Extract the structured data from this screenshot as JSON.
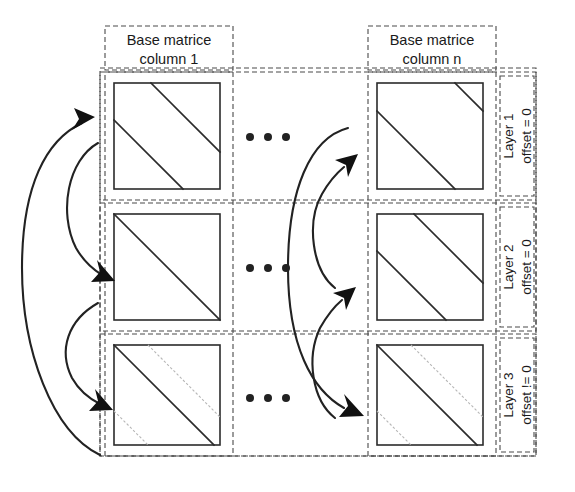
{
  "figure": {
    "background_color": "#ffffff",
    "line_color": "#2b2b2b",
    "dashed_color": "#4a4a4a",
    "faint_color": "#b6b6b6"
  },
  "columns": [
    {
      "id": "col1",
      "line1": "Base matrice",
      "line2": "column 1"
    },
    {
      "id": "coln",
      "line1": "Base matrice",
      "line2": "column n"
    }
  ],
  "ellipsis": {
    "glyph": "•••",
    "count": 3
  },
  "layers": [
    {
      "id": "layer1",
      "name": "Layer 1",
      "offset": "offset = 0"
    },
    {
      "id": "layer2",
      "name": "Layer 2",
      "offset": "offset = 0"
    },
    {
      "id": "layer3",
      "name": "Layer 3",
      "offset": "offset != 0"
    }
  ],
  "cells": [
    {
      "layer": "Layer 1",
      "column": "column 1",
      "pattern": "two-parallel-anti-diagonals",
      "description": "shifted identity: upper diagonal from top edge to right edge, lower diagonal from left edge to bottom edge"
    },
    {
      "layer": "Layer 1",
      "column": "column n",
      "pattern": "two-parallel-anti-diagonals-short-corner",
      "description": "short diagonal segment at top-right corner plus long offset diagonal below"
    },
    {
      "layer": "Layer 2",
      "column": "column 1",
      "pattern": "main-diagonal",
      "description": "identity matrix: single diagonal from top-left to bottom-right"
    },
    {
      "layer": "Layer 2",
      "column": "column n",
      "pattern": "two-parallel-anti-diagonals",
      "description": "shifted identity with two parallel diagonals"
    },
    {
      "layer": "Layer 3",
      "column": "column 1",
      "pattern": "main-diagonal-with-faint-offsets",
      "description": "solid main diagonal plus faint dotted parallel diagonals above-right and below-left"
    },
    {
      "layer": "Layer 3",
      "column": "column n",
      "pattern": "main-diagonal-with-faint-offsets",
      "description": "solid main diagonal plus faint dotted parallel diagonals above-right and below-left"
    }
  ],
  "arrows": {
    "left_group": [
      {
        "id": "left-outer",
        "from": "Layer 3",
        "to": "Layer 1",
        "style": "long outer curve",
        "head": "right"
      },
      {
        "id": "left-mid-1",
        "from": "Layer 1",
        "to": "Layer 2",
        "style": "medium curve",
        "head": "down-right"
      },
      {
        "id": "left-mid-2",
        "from": "Layer 2",
        "to": "Layer 3",
        "style": "medium curve",
        "head": "down-right"
      }
    ],
    "middle_group": [
      {
        "id": "mid-outer",
        "from": "Layer 1",
        "to": "Layer 3",
        "style": "long outer curve",
        "head": "down-right"
      },
      {
        "id": "mid-inner-1",
        "from": "Layer 2",
        "to": "Layer 1",
        "style": "medium curve",
        "head": "up-right"
      },
      {
        "id": "mid-inner-2",
        "from": "Layer 3",
        "to": "Layer 2",
        "style": "medium curve",
        "head": "up-right"
      }
    ]
  }
}
